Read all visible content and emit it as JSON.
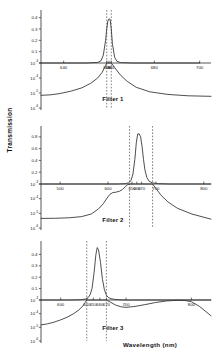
{
  "figure": {
    "y_axis_title": "Transmission",
    "x_axis_title": "Wavelength  (nm)"
  },
  "chart_data": [
    {
      "type": "line",
      "title": "Filter 1",
      "xlabel": "Wavelength  (nm)",
      "ylabel": "Transmission",
      "xlim": [
        630,
        705
      ],
      "x_ticks": [
        640,
        659,
        660,
        661,
        680,
        700
      ],
      "x_tick_labels": [
        "640",
        "659",
        "660",
        "661",
        "680",
        "700"
      ],
      "y_upper_scale": "linear",
      "y_upper_lim": [
        0,
        0.45
      ],
      "y_upper_ticks": [
        0.1,
        0.2,
        0.3,
        0.4
      ],
      "y_upper_tick_labels": [
        "0.1",
        "0.2",
        "0.3",
        "0.4"
      ],
      "y_lower_scale": "log",
      "y_lower_lim": [
        1e-06,
        0.001
      ],
      "y_lower_ticks": [
        0.001,
        0.0001,
        1e-05,
        1e-06
      ],
      "y_lower_tick_labels": [
        "10",
        "10",
        "10",
        "10"
      ],
      "y_lower_exponents": [
        "-3",
        "-4",
        "-5",
        "-6"
      ],
      "cut_lines": [
        659,
        661
      ],
      "peak_wavelength": 660,
      "peak_transmission": 0.39,
      "series_upper": {
        "name": "transmission",
        "x": [
          630,
          640,
          650,
          655,
          656.5,
          657.5,
          658.5,
          659,
          659.5,
          660,
          660.5,
          661,
          661.5,
          662.5,
          663.5,
          665,
          670,
          680,
          700
        ],
        "values": [
          0.0,
          0.0,
          0.0,
          0.005,
          0.02,
          0.07,
          0.2,
          0.3,
          0.37,
          0.39,
          0.385,
          0.3,
          0.17,
          0.05,
          0.015,
          0.004,
          0.0,
          0.0,
          0.0
        ]
      },
      "series_lower": {
        "name": "transmission-log",
        "x": [
          630,
          634,
          638,
          643,
          648,
          652,
          655,
          657,
          658.5,
          659,
          661,
          662.5,
          665,
          668,
          672,
          678,
          686,
          695,
          705
        ],
        "values": [
          7e-06,
          7.5e-06,
          9e-06,
          1.3e-05,
          2.2e-05,
          4.5e-05,
          0.0001,
          0.00024,
          0.0007,
          0.001,
          0.001,
          0.0005,
          0.00016,
          6e-05,
          2.4e-05,
          1.2e-05,
          8e-06,
          6.5e-06,
          6e-06
        ]
      }
    },
    {
      "type": "line",
      "title": "Filter 2",
      "xlabel": "Wavelength  (nm)",
      "ylabel": "Transmission",
      "xlim": [
        460,
        815
      ],
      "x_ticks": [
        500,
        600,
        650,
        660,
        670,
        700,
        800
      ],
      "x_tick_labels": [
        "500",
        "600",
        "650",
        "660",
        "670",
        "700",
        "800"
      ],
      "y_upper_scale": "linear",
      "y_upper_lim": [
        0,
        0.95
      ],
      "y_upper_ticks": [
        0.2,
        0.4,
        0.6,
        0.8
      ],
      "y_upper_tick_labels": [
        "0.2",
        "0.4",
        "0.6",
        "0.8"
      ],
      "y_lower_scale": "log",
      "y_lower_lim": [
        1e-06,
        0.001
      ],
      "y_lower_ticks": [
        0.001,
        0.0001,
        1e-05,
        1e-06
      ],
      "y_lower_tick_labels": [
        "10",
        "10",
        "10",
        "10"
      ],
      "y_lower_exponents": [
        "-3",
        "-4",
        "-5",
        "-6"
      ],
      "cut_lines": [
        645,
        693
      ],
      "peak_wavelength": 662,
      "peak_transmission": 0.85,
      "series_upper": {
        "name": "transmission",
        "x": [
          460,
          560,
          620,
          635,
          643,
          648,
          652,
          656,
          659,
          662,
          665,
          668,
          671,
          674,
          677,
          681,
          686,
          693,
          705,
          730,
          815
        ],
        "values": [
          0.0,
          0.0,
          0.0,
          0.005,
          0.02,
          0.06,
          0.17,
          0.42,
          0.7,
          0.85,
          0.85,
          0.8,
          0.64,
          0.42,
          0.24,
          0.11,
          0.045,
          0.018,
          0.006,
          0.0,
          0.0
        ]
      },
      "series_lower": {
        "name": "transmission-log",
        "x": [
          460,
          490,
          520,
          545,
          565,
          580,
          590,
          598,
          604,
          610,
          617,
          624,
          630,
          636,
          641,
          645,
          693,
          700,
          710,
          725,
          745,
          775,
          815
        ],
        "values": [
          4.5e-06,
          4.6e-06,
          5e-06,
          6e-06,
          9e-06,
          2e-05,
          4.5e-05,
          0.00011,
          0.0002,
          0.00026,
          0.00028,
          0.00032,
          0.00042,
          0.00065,
          0.0009,
          0.001,
          0.001,
          0.0005,
          0.00018,
          6e-05,
          2.2e-05,
          9e-06,
          4e-06
        ]
      }
    },
    {
      "type": "line",
      "title": "Filter 3",
      "xlabel": "Wavelength  (nm)",
      "ylabel": "Transmission",
      "xlim": [
        570,
        830
      ],
      "x_ticks": [
        600,
        640,
        650,
        660,
        670,
        700,
        800
      ],
      "x_tick_labels": [
        "600",
        "640",
        "650",
        "660",
        "670",
        "700",
        "800"
      ],
      "y_upper_scale": "linear",
      "y_upper_lim": [
        0,
        0.5
      ],
      "y_upper_ticks": [
        0.1,
        0.2,
        0.3,
        0.4
      ],
      "y_upper_tick_labels": [
        "0.1",
        "0.2",
        "0.3",
        "0.4"
      ],
      "y_lower_scale": "log",
      "y_lower_lim": [
        1e-06,
        0.001
      ],
      "y_lower_ticks": [
        0.001,
        0.0001,
        1e-05,
        1e-06
      ],
      "y_lower_tick_labels": [
        "10",
        "10",
        "10",
        "10"
      ],
      "y_lower_exponents": [
        "-3",
        "-4",
        "-5",
        "-6"
      ],
      "cut_lines": [
        640,
        670
      ],
      "peak_wavelength": 656,
      "peak_transmission": 0.46,
      "series_upper": {
        "name": "transmission",
        "x": [
          570,
          610,
          630,
          638,
          642,
          645,
          648,
          651,
          654,
          656,
          658,
          661,
          664,
          667,
          670,
          673,
          677,
          682,
          690,
          700,
          760,
          830
        ],
        "values": [
          0.0,
          0.0,
          0.002,
          0.008,
          0.02,
          0.045,
          0.1,
          0.23,
          0.4,
          0.46,
          0.44,
          0.33,
          0.18,
          0.09,
          0.042,
          0.022,
          0.012,
          0.006,
          0.002,
          0.0,
          0.0,
          0.0
        ]
      },
      "series_lower": {
        "name": "transmission-log",
        "x": [
          570,
          580,
          590,
          600,
          610,
          620,
          628,
          634,
          638,
          640,
          670,
          676,
          684,
          692,
          700,
          712,
          728,
          745,
          762,
          778,
          790,
          800,
          812,
          830
        ],
        "values": [
          1.5e-05,
          1.8e-05,
          2.4e-05,
          3.5e-05,
          5.5e-05,
          0.0001,
          0.00019,
          0.00036,
          0.0007,
          0.001,
          0.001,
          0.0007,
          0.00043,
          0.00032,
          0.00029,
          0.00033,
          0.00045,
          0.00065,
          0.00085,
          0.00095,
          0.00092,
          0.00075,
          0.00035,
          7e-05
        ]
      }
    }
  ]
}
